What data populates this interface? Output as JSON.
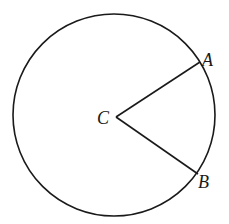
{
  "diagram": {
    "type": "circle-with-radii",
    "circle": {
      "cx": 114,
      "cy": 115,
      "r": 101
    },
    "center": {
      "label": "C",
      "x": 116,
      "y": 117
    },
    "points": [
      {
        "label": "A",
        "x": 200,
        "y": 62
      },
      {
        "label": "B",
        "x": 198,
        "y": 174
      }
    ],
    "segments": [
      {
        "from": "C",
        "to": "A"
      },
      {
        "from": "C",
        "to": "B"
      }
    ],
    "stroke_color": "#1a1a1a",
    "background": "#ffffff"
  }
}
